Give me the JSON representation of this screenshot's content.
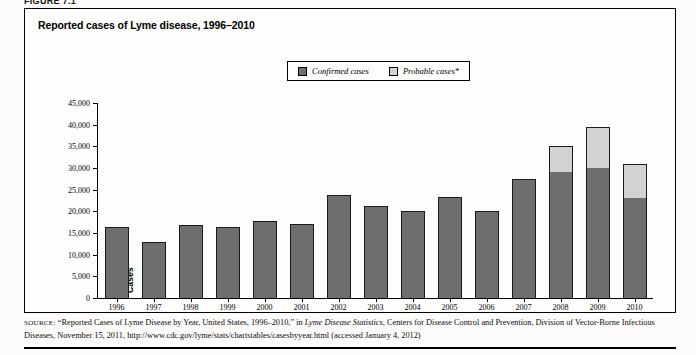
{
  "figure": {
    "label": "FIGURE 7.1"
  },
  "chart_title": "Reported cases of Lyme disease, 1996–2010",
  "legend": {
    "confirmed_label": "Confirmed cases",
    "probable_label": "Probable cases*",
    "confirmed_color": "#6e6e6e",
    "probable_color": "#d2d2d2"
  },
  "axis": {
    "y_title": "Cases",
    "y_ticks": [
      "0",
      "5,000",
      "10,000",
      "15,000",
      "20,000",
      "25,000",
      "30,000",
      "35,000",
      "40,000",
      "45,000"
    ]
  },
  "source": {
    "prefix": "SOURCE:",
    "line": " “Reported Cases of Lyme Disease by Year, United States, 1996–2010,” in ",
    "italic1": "Lyme Disease Statistics",
    "line2": ", Centers for Disease Control and Prevention, Division of Vector-Borne Infectious Diseases, November 15, 2011, http://www.cdc.gov/lyme/stats/chartstables/casesbyyear.html (accessed January 4, 2012)"
  },
  "chart_data": {
    "type": "bar",
    "subtype": "stacked",
    "title": "Reported cases of Lyme disease, 1996–2010",
    "xlabel": "",
    "ylabel": "Cases",
    "ylim": [
      0,
      45000
    ],
    "ytick_interval": 5000,
    "grid": false,
    "legend_position": "top-center",
    "categories": [
      "1996",
      "1997",
      "1998",
      "1999",
      "2000",
      "2001",
      "2002",
      "2003",
      "2004",
      "2005",
      "2006",
      "2007",
      "2008",
      "2009",
      "2010"
    ],
    "series": [
      {
        "name": "Confirmed cases",
        "color": "#6e6e6e",
        "values": [
          16500,
          13000,
          16800,
          16300,
          17700,
          17000,
          23700,
          21300,
          20000,
          23300,
          20000,
          27400,
          29000,
          30000,
          23000
        ]
      },
      {
        "name": "Probable cases*",
        "color": "#d2d2d2",
        "values": [
          0,
          0,
          0,
          0,
          0,
          0,
          0,
          0,
          0,
          0,
          0,
          0,
          6000,
          9500,
          8000
        ]
      }
    ],
    "totals": [
      16500,
      13000,
      16800,
      16300,
      17700,
      17000,
      23700,
      21300,
      20000,
      23300,
      20000,
      27400,
      35000,
      39500,
      31000
    ],
    "annotations": [
      "* Probable cases reported beginning 2008"
    ]
  }
}
